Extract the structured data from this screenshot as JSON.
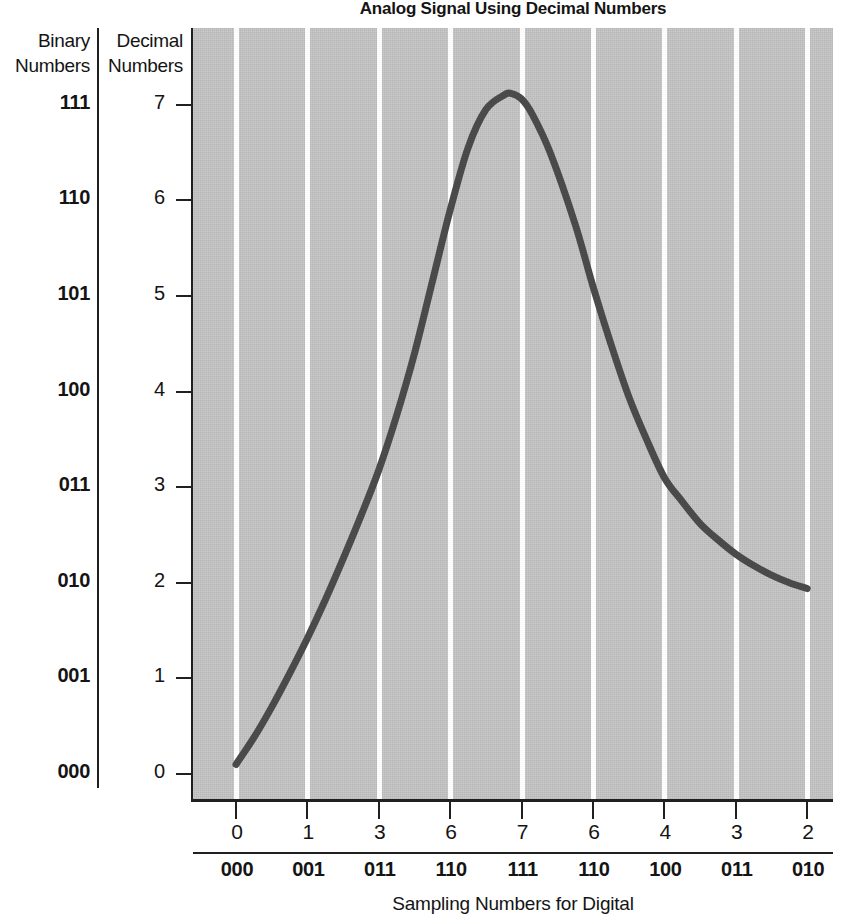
{
  "chart_data": {
    "type": "line",
    "title": "Analog Signal Using Decimal Numbers",
    "xlabel": "Sampling Numbers for Digital",
    "ylabel": "Decimal Numbers",
    "ylabel_secondary": "Binary Numbers",
    "xlim": [
      0,
      8
    ],
    "ylim": [
      0,
      7.6
    ],
    "grid": true,
    "grid_orientation": "vertical",
    "legend": "none",
    "plot_background": "#c4c4c4",
    "gridline_color": "#fbfbfb",
    "line_color": "#4a4a4a",
    "axis_color": "#202020",
    "y_ticks": [
      {
        "decimal": "7",
        "binary": "111",
        "value": 7
      },
      {
        "decimal": "6",
        "binary": "110",
        "value": 6
      },
      {
        "decimal": "5",
        "binary": "101",
        "value": 5
      },
      {
        "decimal": "4",
        "binary": "100",
        "value": 4
      },
      {
        "decimal": "3",
        "binary": "011",
        "value": 3
      },
      {
        "decimal": "2",
        "binary": "010",
        "value": 2
      },
      {
        "decimal": "1",
        "binary": "001",
        "value": 1
      },
      {
        "decimal": "0",
        "binary": "000",
        "value": 0
      }
    ],
    "x_ticks": [
      {
        "index": 0,
        "decimal": "0",
        "binary": "000"
      },
      {
        "index": 1,
        "decimal": "1",
        "binary": "001"
      },
      {
        "index": 2,
        "decimal": "3",
        "binary": "011"
      },
      {
        "index": 3,
        "decimal": "6",
        "binary": "110"
      },
      {
        "index": 4,
        "decimal": "7",
        "binary": "111"
      },
      {
        "index": 5,
        "decimal": "6",
        "binary": "110"
      },
      {
        "index": 6,
        "decimal": "4",
        "binary": "100"
      },
      {
        "index": 7,
        "decimal": "3",
        "binary": "011"
      },
      {
        "index": 8,
        "decimal": "2",
        "binary": "010"
      }
    ],
    "categories": [
      "0",
      "1",
      "3",
      "6",
      "7",
      "6",
      "4",
      "3",
      "2"
    ],
    "sample_values": [
      0,
      1,
      3,
      6,
      7,
      6,
      4,
      3,
      2
    ],
    "sample_binary": [
      "000",
      "001",
      "011",
      "110",
      "111",
      "110",
      "100",
      "011",
      "010"
    ],
    "series": [
      {
        "name": "Analog Signal",
        "x": [
          0,
          0.25,
          0.5,
          0.75,
          1,
          1.25,
          1.5,
          1.75,
          2,
          2.25,
          2.5,
          2.75,
          3,
          3.25,
          3.5,
          3.75,
          3.85,
          4,
          4.15,
          4.4,
          4.75,
          5,
          5.25,
          5.5,
          5.75,
          6,
          6.25,
          6.5,
          6.75,
          7,
          7.25,
          7.5,
          7.75,
          8
        ],
        "values": [
          0.1,
          0.38,
          0.7,
          1.05,
          1.42,
          1.82,
          2.25,
          2.7,
          3.18,
          3.75,
          4.4,
          5.15,
          5.9,
          6.55,
          6.95,
          7.1,
          7.12,
          7.06,
          6.9,
          6.5,
          5.75,
          5.1,
          4.5,
          3.95,
          3.5,
          3.1,
          2.85,
          2.62,
          2.45,
          2.3,
          2.18,
          2.08,
          2.0,
          1.94
        ]
      }
    ],
    "peak": {
      "x": 3.85,
      "value": 7.1
    },
    "start_point": {
      "x": 0,
      "value": 0.1
    },
    "end_point": {
      "x": 8,
      "value": 1.94
    }
  },
  "headers": {
    "binary": "Binary\nNumbers",
    "binary_line1": "Binary",
    "binary_line2": "Numbers",
    "decimal": "Decimal\nNumbers",
    "decimal_line1": "Decimal",
    "decimal_line2": "Numbers"
  }
}
